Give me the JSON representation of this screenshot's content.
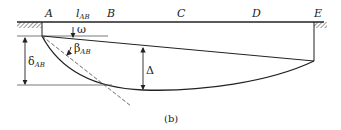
{
  "figure": {
    "caption": "(b)",
    "colors": {
      "stroke": "#222222",
      "background": "#ffffff"
    }
  },
  "points": {
    "A": "A",
    "B": "B",
    "C": "C",
    "D": "D",
    "E": "E"
  },
  "span_label": {
    "main": "l",
    "sub": "AB"
  },
  "annotations": {
    "omega": "ω",
    "beta": {
      "main": "β",
      "sub": "AB"
    },
    "delta_ab": {
      "main": "δ",
      "sub": "AB"
    },
    "Delta": "Δ"
  }
}
